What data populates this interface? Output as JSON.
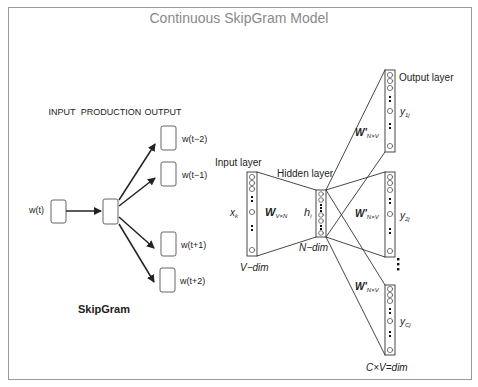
{
  "title": "Continuous SkipGram Model",
  "skipgram": {
    "headers": {
      "input": "INPUT",
      "production": "PRODUCTION",
      "output": "OUTPUT"
    },
    "input_label": "w(t)",
    "outputs": [
      "w(t−2)",
      "w(t−1)",
      "w(t+1)",
      "w(t+2)"
    ],
    "caption": "SkipGram"
  },
  "network": {
    "input_layer_label": "Input layer",
    "hidden_layer_label": "Hidden layer",
    "output_layer_label": "Output layer",
    "input_var": "x",
    "input_sub": "k",
    "hidden_var": "h",
    "hidden_sub": "i",
    "weight_in": "W",
    "weight_in_sub": "V×N",
    "weight_out": "W'",
    "weight_out_sub": "N×V",
    "outputs": [
      {
        "var": "y",
        "sub": "1j"
      },
      {
        "var": "y",
        "sub": "2j"
      },
      {
        "var": "y",
        "sub": "Cj"
      }
    ],
    "v_dim": "V−dim",
    "n_dim": "N−dim",
    "cv_dim": "C×V=dim"
  },
  "colors": {
    "stroke": "#222222",
    "frame": "#9a9a9a",
    "title": "#8a8a8a"
  }
}
